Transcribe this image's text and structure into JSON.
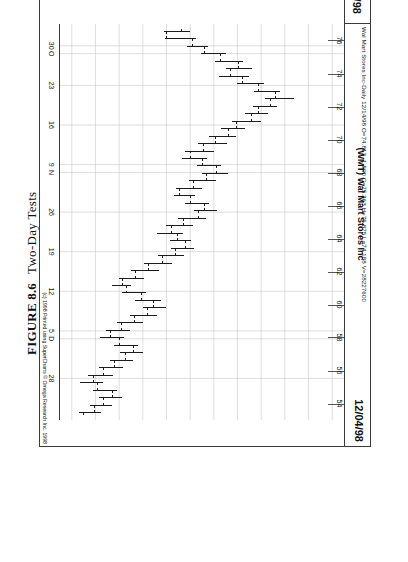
{
  "figure": {
    "number": "FIGURE 8.6",
    "title": "Two-Day Tests"
  },
  "chart_header": {
    "left_date": "09/22/98",
    "right_date": "12/04/98",
    "symbol_title": "(WMT) Wal Mart Stores Inc",
    "quote_line": "Wal Mart Stores Inc-Daily  12/14/98  O=74.813 -1.500  C=75.363  H=75.875  L=74.188  V=28227600",
    "copyright": "(c) 1998 Printed using SuperCharts © Omega Research Inc. 1998"
  },
  "chart_data": {
    "type": "ohlc",
    "title": "(WMT) Wal Mart Stores Inc",
    "subtitle": "Wal Mart Stores Inc-Daily",
    "xlabel": "",
    "ylabel": "Price",
    "orientation": "rotated-90",
    "grid": true,
    "ylim": [
      53,
      77
    ],
    "price_ticks": [
      76,
      74,
      72,
      70,
      68,
      66,
      64,
      62,
      60,
      58,
      56,
      54
    ],
    "date_ticks": [
      "30",
      "O",
      "23",
      "16",
      "9",
      "N",
      "26",
      "19",
      "12",
      "5",
      "D",
      "28"
    ],
    "date_tick_positions": [
      0.055,
      0.075,
      0.155,
      0.255,
      0.355,
      0.375,
      0.475,
      0.575,
      0.675,
      0.775,
      0.795,
      0.895
    ],
    "legend": [],
    "bars": [
      {
        "i": 0,
        "o": 63.3,
        "h": 64.0,
        "l": 61.8,
        "c": 62.0
      },
      {
        "i": 1,
        "o": 62.0,
        "h": 64.5,
        "l": 61.9,
        "c": 64.2
      },
      {
        "i": 2,
        "o": 64.2,
        "h": 65.5,
        "l": 63.7,
        "c": 65.2
      },
      {
        "i": 3,
        "o": 65.2,
        "h": 67.0,
        "l": 64.9,
        "c": 66.6
      },
      {
        "i": 4,
        "o": 66.6,
        "h": 68.5,
        "l": 66.1,
        "c": 68.1
      },
      {
        "i": 5,
        "o": 68.1,
        "h": 69.2,
        "l": 67.0,
        "c": 67.4
      },
      {
        "i": 6,
        "o": 67.4,
        "h": 69.0,
        "l": 66.4,
        "c": 68.4
      },
      {
        "i": 7,
        "o": 68.4,
        "h": 70.2,
        "l": 68.0,
        "c": 69.8
      },
      {
        "i": 8,
        "o": 69.8,
        "h": 71.6,
        "l": 69.4,
        "c": 71.2
      },
      {
        "i": 9,
        "o": 71.2,
        "h": 72.8,
        "l": 70.3,
        "c": 70.8
      },
      {
        "i": 10,
        "o": 70.8,
        "h": 71.3,
        "l": 69.3,
        "c": 69.8
      },
      {
        "i": 11,
        "o": 69.8,
        "h": 70.6,
        "l": 68.6,
        "c": 69.2
      },
      {
        "i": 12,
        "o": 69.2,
        "h": 70.0,
        "l": 67.5,
        "c": 67.9
      },
      {
        "i": 13,
        "o": 67.9,
        "h": 68.6,
        "l": 66.6,
        "c": 67.2
      },
      {
        "i": 14,
        "o": 67.2,
        "h": 67.9,
        "l": 65.6,
        "c": 66.1
      },
      {
        "i": 15,
        "o": 66.1,
        "h": 67.1,
        "l": 64.7,
        "c": 65.1
      },
      {
        "i": 16,
        "o": 65.1,
        "h": 66.0,
        "l": 63.6,
        "c": 64.0
      },
      {
        "i": 17,
        "o": 64.0,
        "h": 65.4,
        "l": 63.3,
        "c": 65.0
      },
      {
        "i": 18,
        "o": 65.0,
        "h": 66.6,
        "l": 64.6,
        "c": 66.2
      },
      {
        "i": 19,
        "o": 66.2,
        "h": 67.2,
        "l": 65.0,
        "c": 65.4
      },
      {
        "i": 20,
        "o": 65.4,
        "h": 66.2,
        "l": 63.9,
        "c": 64.3
      },
      {
        "i": 21,
        "o": 64.3,
        "h": 65.0,
        "l": 62.8,
        "c": 63.1
      },
      {
        "i": 22,
        "o": 63.1,
        "h": 64.4,
        "l": 62.6,
        "c": 64.0
      },
      {
        "i": 23,
        "o": 64.0,
        "h": 65.6,
        "l": 63.6,
        "c": 65.2
      },
      {
        "i": 24,
        "o": 65.2,
        "h": 66.3,
        "l": 64.3,
        "c": 64.7
      },
      {
        "i": 25,
        "o": 64.7,
        "h": 65.3,
        "l": 63.0,
        "c": 63.4
      },
      {
        "i": 26,
        "o": 63.4,
        "h": 64.2,
        "l": 62.0,
        "c": 62.4
      },
      {
        "i": 27,
        "o": 62.4,
        "h": 63.4,
        "l": 61.2,
        "c": 62.9
      },
      {
        "i": 28,
        "o": 62.9,
        "h": 64.1,
        "l": 62.3,
        "c": 63.6
      },
      {
        "i": 29,
        "o": 63.6,
        "h": 64.3,
        "l": 62.4,
        "c": 62.8
      },
      {
        "i": 30,
        "o": 62.8,
        "h": 63.5,
        "l": 61.3,
        "c": 61.7
      },
      {
        "i": 31,
        "o": 61.7,
        "h": 62.5,
        "l": 60.1,
        "c": 60.5
      },
      {
        "i": 32,
        "o": 60.5,
        "h": 61.4,
        "l": 59.0,
        "c": 59.4
      },
      {
        "i": 33,
        "o": 59.4,
        "h": 60.1,
        "l": 58.0,
        "c": 58.3
      },
      {
        "i": 34,
        "o": 58.3,
        "h": 59.0,
        "l": 57.4,
        "c": 58.6
      },
      {
        "i": 35,
        "o": 58.6,
        "h": 60.3,
        "l": 58.2,
        "c": 59.9
      },
      {
        "i": 36,
        "o": 59.9,
        "h": 61.5,
        "l": 59.3,
        "c": 60.9
      },
      {
        "i": 37,
        "o": 60.9,
        "h": 62.0,
        "l": 60.0,
        "c": 60.4
      },
      {
        "i": 38,
        "o": 60.4,
        "h": 61.2,
        "l": 58.9,
        "c": 59.3
      },
      {
        "i": 39,
        "o": 59.3,
        "h": 60.0,
        "l": 57.8,
        "c": 58.2
      },
      {
        "i": 40,
        "o": 58.2,
        "h": 58.9,
        "l": 56.9,
        "c": 57.3
      },
      {
        "i": 41,
        "o": 57.3,
        "h": 58.4,
        "l": 56.4,
        "c": 58.0
      },
      {
        "i": 42,
        "o": 58.0,
        "h": 59.6,
        "l": 57.6,
        "c": 59.2
      },
      {
        "i": 43,
        "o": 59.2,
        "h": 60.0,
        "l": 58.1,
        "c": 58.5
      },
      {
        "i": 44,
        "o": 58.5,
        "h": 59.2,
        "l": 57.2,
        "c": 57.6
      },
      {
        "i": 45,
        "o": 57.6,
        "h": 58.3,
        "l": 56.3,
        "c": 56.7
      },
      {
        "i": 46,
        "o": 56.7,
        "h": 57.5,
        "l": 55.4,
        "c": 55.8
      },
      {
        "i": 47,
        "o": 55.8,
        "h": 56.6,
        "l": 54.7,
        "c": 56.2
      },
      {
        "i": 48,
        "o": 56.2,
        "h": 57.8,
        "l": 55.8,
        "c": 57.4
      },
      {
        "i": 49,
        "o": 57.4,
        "h": 58.2,
        "l": 56.3,
        "c": 56.7
      },
      {
        "i": 50,
        "o": 56.7,
        "h": 57.4,
        "l": 55.5,
        "c": 55.9
      },
      {
        "i": 51,
        "o": 55.9,
        "h": 56.5,
        "l": 54.6,
        "c": 55.0
      }
    ]
  }
}
